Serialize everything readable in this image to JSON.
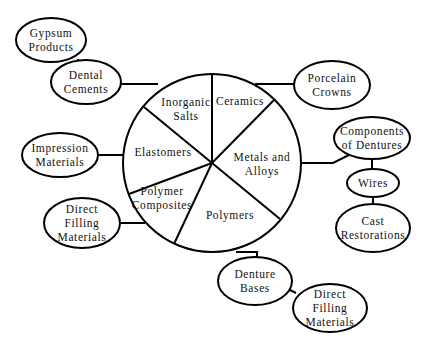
{
  "diagram": {
    "type": "concept-map",
    "center": {
      "name": "dental-materials-pie",
      "segments": [
        {
          "id": "inorganic-salts",
          "lines": [
            "Inorganic",
            "Salts"
          ]
        },
        {
          "id": "ceramics",
          "lines": [
            "Ceramics"
          ]
        },
        {
          "id": "metals-and-alloys",
          "lines": [
            "Metals and",
            "Alloys"
          ]
        },
        {
          "id": "polymers",
          "lines": [
            "Polymers"
          ]
        },
        {
          "id": "polymer-composites",
          "lines": [
            "Polymer",
            "Composites"
          ]
        },
        {
          "id": "elastomers",
          "lines": [
            "Elastomers"
          ]
        }
      ]
    },
    "nodes": [
      {
        "id": "gypsum-products",
        "lines": [
          "Gypsum",
          "Products"
        ]
      },
      {
        "id": "dental-cements",
        "lines": [
          "Dental",
          "Cements"
        ]
      },
      {
        "id": "porcelain-crowns",
        "lines": [
          "Porcelain",
          "Crowns"
        ]
      },
      {
        "id": "components-of-dentures",
        "lines": [
          "Components",
          "of Dentures"
        ]
      },
      {
        "id": "wires",
        "lines": [
          "Wires"
        ]
      },
      {
        "id": "cast-restorations",
        "lines": [
          "Cast",
          "Restorations"
        ]
      },
      {
        "id": "impression-materials",
        "lines": [
          "Impression",
          "Materials"
        ]
      },
      {
        "id": "direct-filling-materials-left",
        "lines": [
          "Direct",
          "Filling",
          "Materials"
        ]
      },
      {
        "id": "denture-bases",
        "lines": [
          "Denture",
          "Bases"
        ]
      },
      {
        "id": "direct-filling-materials-bottom",
        "lines": [
          "Direct",
          "Filling",
          "Materials"
        ]
      }
    ],
    "edges": [
      {
        "from": "gypsum-products",
        "to": "dental-cements"
      },
      {
        "from": "dental-cements",
        "to": "inorganic-salts"
      },
      {
        "from": "ceramics",
        "to": "porcelain-crowns"
      },
      {
        "from": "metals-and-alloys",
        "to": "components-of-dentures"
      },
      {
        "from": "components-of-dentures",
        "to": "wires"
      },
      {
        "from": "wires",
        "to": "cast-restorations"
      },
      {
        "from": "impression-materials",
        "to": "elastomers"
      },
      {
        "from": "direct-filling-materials-left",
        "to": "polymer-composites"
      },
      {
        "from": "polymers",
        "to": "denture-bases"
      },
      {
        "from": "denture-bases",
        "to": "direct-filling-materials-bottom"
      }
    ]
  }
}
